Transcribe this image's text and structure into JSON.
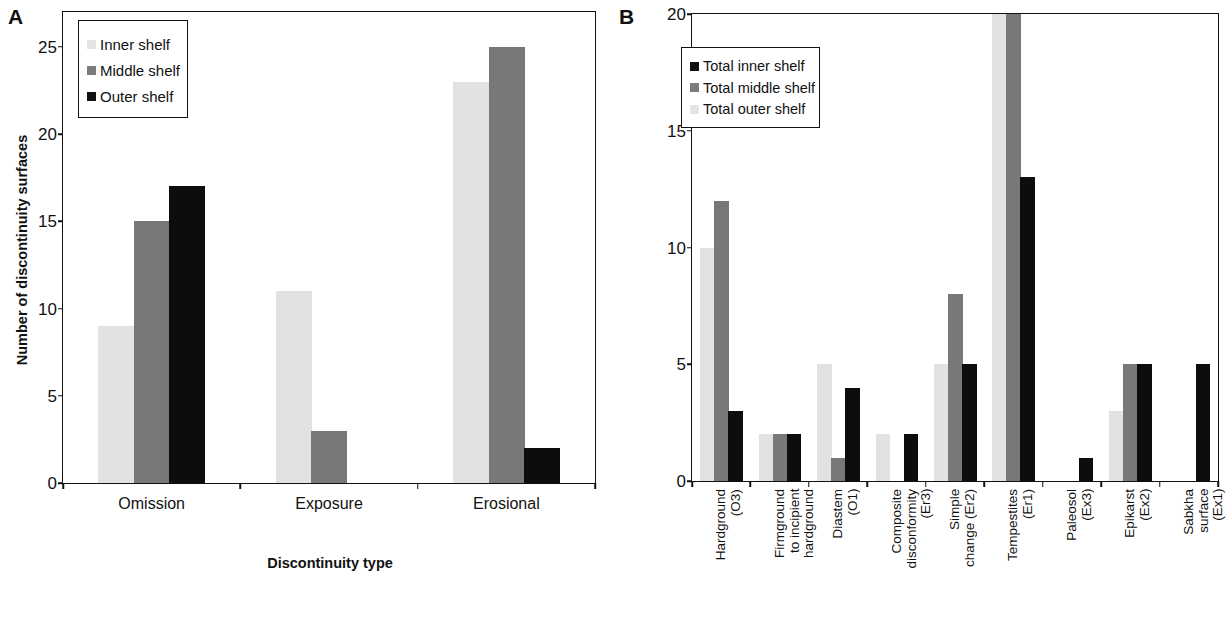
{
  "figure": {
    "panels": [
      {
        "letter": "A",
        "y_axis_title": "Number of discontinuity surfaces",
        "x_axis_title": "Discontinuity type",
        "legend": [
          {
            "label": "Inner shelf",
            "color": "#e4e4e4"
          },
          {
            "label": "Middle shelf",
            "color": "#7c7c7c"
          },
          {
            "label": "Outer shelf",
            "color": "#101010"
          }
        ]
      },
      {
        "letter": "B",
        "legend": [
          {
            "label": "Total inner shelf",
            "color": "#101010"
          },
          {
            "label": "Total middle shelf",
            "color": "#7c7c7c"
          },
          {
            "label": "Total outer shelf",
            "color": "#e4e4e4"
          }
        ]
      }
    ]
  },
  "chart_data": [
    {
      "type": "bar",
      "panel": "A",
      "title": "",
      "xlabel": "Discontinuity type",
      "ylabel": "Number of discontinuity surfaces",
      "ylim": [
        0,
        27
      ],
      "yticks": [
        0,
        5,
        10,
        15,
        20,
        25
      ],
      "grid": false,
      "legend_position": "top-left",
      "categories": [
        "Omission",
        "Exposure",
        "Erosional"
      ],
      "series": [
        {
          "name": "Inner shelf",
          "color": "#e4e4e4",
          "values": [
            9,
            11,
            23
          ]
        },
        {
          "name": "Middle shelf",
          "color": "#7c7c7c",
          "values": [
            15,
            3,
            25
          ]
        },
        {
          "name": "Outer shelf",
          "color": "#101010",
          "values": [
            17,
            0,
            2
          ]
        }
      ]
    },
    {
      "type": "bar",
      "panel": "B",
      "title": "",
      "xlabel": "",
      "ylabel": "",
      "ylim": [
        0,
        20
      ],
      "yticks": [
        0,
        5,
        10,
        15,
        20
      ],
      "grid": false,
      "legend_position": "top-left",
      "categories": [
        "Hardground (O3)",
        "Firmground to incipient hardground",
        "Diastem (O1)",
        "Composite disconformity (Er3)",
        "Simple change (Er2)",
        "Tempestites (Er1)",
        "Paleosol (Ex3)",
        "Epikarst (Ex2)",
        "Sabkha surface (Ex1)"
      ],
      "category_lines": [
        [
          "Hardground",
          "(O3)"
        ],
        [
          "Firmground",
          "to incipient",
          "hardground"
        ],
        [
          "Diastem",
          "(O1)"
        ],
        [
          "Composite",
          "disconformity",
          "(Er3)"
        ],
        [
          "Simple",
          "change (Er2)"
        ],
        [
          "Tempestites",
          "(Er1)"
        ],
        [
          "Paleosol",
          "(Ex3)"
        ],
        [
          "Epikarst",
          "(Ex2)"
        ],
        [
          "Sabkha",
          "surface",
          "(Ex1)"
        ]
      ],
      "series": [
        {
          "name": "Total outer shelf",
          "color": "#e4e4e4",
          "values": [
            10,
            2,
            5,
            2,
            5,
            20,
            0,
            3,
            0
          ]
        },
        {
          "name": "Total middle shelf",
          "color": "#7c7c7c",
          "values": [
            12,
            2,
            1,
            0,
            8,
            20,
            0,
            5,
            0
          ]
        },
        {
          "name": "Total inner shelf",
          "color": "#101010",
          "values": [
            3,
            2,
            4,
            2,
            5,
            13,
            1,
            5,
            5
          ]
        }
      ],
      "series_draw_order": [
        {
          "name": "Total outer shelf",
          "color": "#e4e4e4",
          "values": [
            10,
            2,
            5,
            2,
            5,
            20,
            0,
            3,
            0
          ]
        },
        {
          "name": "Total middle shelf",
          "color": "#7c7c7c",
          "values": [
            12,
            2,
            1,
            0,
            8,
            20,
            0,
            5,
            0
          ]
        },
        {
          "name": "Total inner shelf",
          "color": "#101010",
          "values": [
            3,
            2,
            4,
            2,
            5,
            13,
            1,
            5,
            5
          ]
        }
      ]
    }
  ]
}
